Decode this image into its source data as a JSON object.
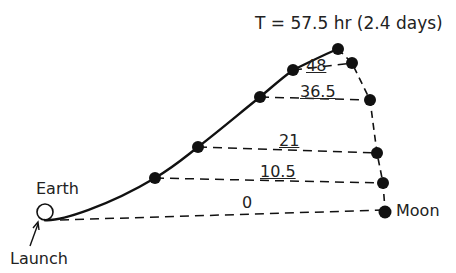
{
  "title": "T = 57.5 hr (2.4 days)",
  "labels": {
    "earth": "Earth",
    "moon": "Moon",
    "launch": "Launch"
  },
  "time_marks": [
    "0",
    "10.5",
    "21",
    "36.5",
    "48"
  ],
  "colors": {
    "ink": "#111111",
    "background": "#ffffff"
  }
}
